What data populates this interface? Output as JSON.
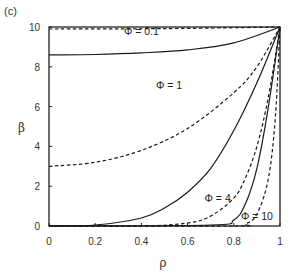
{
  "panel_label": "(c)",
  "chart_data": {
    "type": "line",
    "title": "",
    "xlabel": "ρ",
    "ylabel": "β",
    "xlim": [
      0,
      1
    ],
    "ylim": [
      0,
      10
    ],
    "xticks": [
      "0",
      "0.2",
      "0.4",
      "0.6",
      "0.8",
      "1"
    ],
    "yticks": [
      "0",
      "2",
      "4",
      "6",
      "8",
      "10"
    ],
    "grid": false,
    "legend": "inline annotations",
    "annotations": [
      {
        "text": "Φ = 0.1",
        "x": 0.4,
        "y": 9.6
      },
      {
        "text": "Φ = 1",
        "x": 0.52,
        "y": 6.9
      },
      {
        "text": "Φ = 4",
        "x": 0.73,
        "y": 1.2
      },
      {
        "text": "Φ = 10",
        "x": 0.9,
        "y": 0.3
      }
    ],
    "series": [
      {
        "name": "Φ = 0.1 (solid)",
        "style": "solid",
        "x": [
          0,
          0.2,
          0.4,
          0.6,
          0.8,
          1.0
        ],
        "y": [
          8.6,
          8.62,
          8.7,
          8.85,
          9.2,
          10
        ]
      },
      {
        "name": "Φ = 0.1 (dashed)",
        "style": "dashed",
        "x": [
          0,
          0.5,
          1.0
        ],
        "y": [
          9.9,
          9.92,
          10
        ]
      },
      {
        "name": "Φ = 1 (dashed)",
        "style": "dashed",
        "x": [
          0,
          0.2,
          0.4,
          0.6,
          0.8,
          0.9,
          1.0
        ],
        "y": [
          3.0,
          3.2,
          3.8,
          4.9,
          6.7,
          8.0,
          10
        ]
      },
      {
        "name": "Φ = 4 (solid)",
        "style": "solid",
        "x": [
          0,
          0.2,
          0.4,
          0.5,
          0.6,
          0.7,
          0.8,
          0.9,
          1.0
        ],
        "y": [
          0,
          0.05,
          0.4,
          0.9,
          1.7,
          2.9,
          4.8,
          7.2,
          10
        ]
      },
      {
        "name": "Φ = 4 (dashed)",
        "style": "dashed",
        "x": [
          0,
          0.4,
          0.6,
          0.7,
          0.8,
          0.85,
          0.9,
          0.95,
          1.0
        ],
        "y": [
          0,
          0.0,
          0.15,
          0.5,
          1.4,
          2.4,
          4.0,
          6.5,
          10
        ]
      },
      {
        "name": "Φ = 10 (solid)",
        "style": "solid",
        "x": [
          0,
          0.7,
          0.8,
          0.85,
          0.9,
          0.95,
          1.0
        ],
        "y": [
          0,
          0.05,
          0.3,
          1.1,
          2.9,
          6.0,
          10
        ]
      },
      {
        "name": "Φ = 10 (dashed)",
        "style": "dashed",
        "x": [
          0,
          0.8,
          0.85,
          0.9,
          0.95,
          0.98,
          1.0
        ],
        "y": [
          0,
          0.0,
          0.1,
          0.6,
          2.4,
          5.5,
          10
        ]
      }
    ]
  }
}
